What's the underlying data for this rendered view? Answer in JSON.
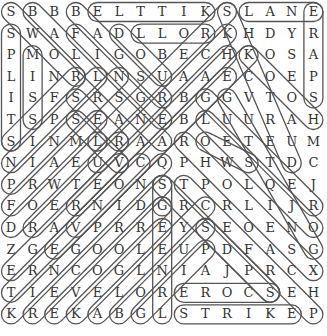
{
  "puzzle": {
    "type": "word-search",
    "rows": 15,
    "cols": 15,
    "grid": [
      [
        "S",
        "B",
        "B",
        "B",
        "E",
        "L",
        "T",
        "T",
        "I",
        "K",
        "S",
        "L",
        "A",
        "N",
        "E"
      ],
      [
        "S",
        "W",
        "A",
        "F",
        "A",
        "D",
        "L",
        "L",
        "O",
        "R",
        "K",
        "H",
        "D",
        "Y",
        "R"
      ],
      [
        "P",
        "M",
        "O",
        "L",
        "I",
        "G",
        "O",
        "B",
        "E",
        "C",
        "H",
        "K",
        "O",
        "S",
        "A"
      ],
      [
        "L",
        "I",
        "N",
        "R",
        "L",
        "N",
        "S",
        "U",
        "A",
        "A",
        "E",
        "C",
        "O",
        "E",
        "P"
      ],
      [
        "I",
        "S",
        "F",
        "S",
        "R",
        "S",
        "G",
        "R",
        "B",
        "G",
        "G",
        "V",
        "T",
        "O",
        "S"
      ],
      [
        "T",
        "S",
        "P",
        "S",
        "E",
        "A",
        "N",
        "E",
        "B",
        "L",
        "U",
        "U",
        "R",
        "A",
        "H"
      ],
      [
        "S",
        "I",
        "N",
        "M",
        "L",
        "R",
        "A",
        "A",
        "R",
        "O",
        "E",
        "T",
        "E",
        "U",
        "M"
      ],
      [
        "N",
        "I",
        "A",
        "E",
        "U",
        "V",
        "C",
        "Q",
        "P",
        "H",
        "W",
        "S",
        "T",
        "D",
        "C"
      ],
      [
        "P",
        "R",
        "W",
        "T",
        "E",
        "O",
        "N",
        "S",
        "T",
        "P",
        "O",
        "L",
        "Q",
        "E",
        "J"
      ],
      [
        "F",
        "O",
        "E",
        "R",
        "N",
        "I",
        "D",
        "G",
        "R",
        "C",
        "R",
        "L",
        "I",
        "J",
        "R"
      ],
      [
        "D",
        "R",
        "A",
        "V",
        "P",
        "R",
        "R",
        "E",
        "Y",
        "S",
        "E",
        "O",
        "E",
        "N",
        "O"
      ],
      [
        "Z",
        "G",
        "E",
        "G",
        "O",
        "O",
        "L",
        "E",
        "U",
        "P",
        "D",
        "F",
        "A",
        "S",
        "G"
      ],
      [
        "E",
        "R",
        "N",
        "C",
        "O",
        "G",
        "L",
        "N",
        "I",
        "A",
        "J",
        "P",
        "R",
        "C",
        "X"
      ],
      [
        "T",
        "I",
        "E",
        "V",
        "E",
        "L",
        "O",
        "R",
        "E",
        "R",
        "O",
        "C",
        "S",
        "E",
        "H"
      ],
      [
        "K",
        "R",
        "E",
        "K",
        "A",
        "B",
        "G",
        "L",
        "S",
        "T",
        "R",
        "I",
        "K",
        "E",
        "P"
      ]
    ],
    "highlights": [
      {
        "r1": 0,
        "c1": 4,
        "r2": 0,
        "c2": 9
      },
      {
        "r1": 0,
        "c1": 11,
        "r2": 0,
        "c2": 14
      },
      {
        "r1": 1,
        "c1": 6,
        "r2": 1,
        "c2": 9
      },
      {
        "r1": 13,
        "c1": 8,
        "r2": 13,
        "c2": 12
      },
      {
        "r1": 14,
        "c1": 8,
        "r2": 14,
        "c2": 13
      },
      {
        "r1": 1,
        "c1": 0,
        "r2": 6,
        "c2": 0
      },
      {
        "r1": 2,
        "c1": 1,
        "r2": 5,
        "c2": 1
      },
      {
        "r1": 0,
        "c1": 14,
        "r2": 4,
        "c2": 14
      },
      {
        "r1": 0,
        "c1": 0,
        "r2": 3,
        "c2": 3
      },
      {
        "r1": 0,
        "c1": 1,
        "r2": 6,
        "c2": 7
      },
      {
        "r1": 0,
        "c1": 3,
        "r2": 4,
        "c2": 7
      },
      {
        "r1": 1,
        "c1": 3,
        "r2": 5,
        "c2": 7
      },
      {
        "r1": 1,
        "c1": 5,
        "r2": 3,
        "c2": 7
      },
      {
        "r1": 0,
        "c1": 10,
        "r2": 6,
        "c2": 4
      },
      {
        "r1": 1,
        "c1": 10,
        "r2": 7,
        "c2": 4
      },
      {
        "r1": 2,
        "c1": 10,
        "r2": 9,
        "c2": 3
      },
      {
        "r1": 2,
        "c1": 11,
        "r2": 10,
        "c2": 3
      },
      {
        "r1": 3,
        "c1": 10,
        "r2": 11,
        "c2": 2
      },
      {
        "r1": 0,
        "c1": 10,
        "r2": 7,
        "c2": 13
      },
      {
        "r1": 2,
        "c1": 11,
        "r2": 5,
        "c2": 14
      },
      {
        "r1": 4,
        "c1": 9,
        "r2": 9,
        "c2": 14
      },
      {
        "r1": 4,
        "c1": 10,
        "r2": 11,
        "c2": 14
      },
      {
        "r1": 5,
        "c1": 9,
        "r2": 10,
        "c2": 14
      },
      {
        "r1": 6,
        "c1": 8,
        "r2": 12,
        "c2": 14
      },
      {
        "r1": 4,
        "c1": 3,
        "r2": 6,
        "c2": 5
      },
      {
        "r1": 5,
        "c1": 3,
        "r2": 7,
        "c2": 5
      },
      {
        "r1": 6,
        "c1": 9,
        "r2": 7,
        "c2": 11
      },
      {
        "r1": 6,
        "c1": 0,
        "r2": 3,
        "c2": 3
      },
      {
        "r1": 7,
        "c1": 0,
        "r2": 3,
        "c2": 4
      },
      {
        "r1": 8,
        "c1": 0,
        "r2": 3,
        "c2": 5
      },
      {
        "r1": 9,
        "c1": 0,
        "r2": 5,
        "c2": 4
      },
      {
        "r1": 10,
        "c1": 0,
        "r2": 6,
        "c2": 4
      },
      {
        "r1": 10,
        "c1": 1,
        "r2": 6,
        "c2": 5
      },
      {
        "r1": 12,
        "c1": 0,
        "r2": 7,
        "c2": 5
      },
      {
        "r1": 13,
        "c1": 0,
        "r2": 7,
        "c2": 6
      },
      {
        "r1": 14,
        "c1": 0,
        "r2": 7,
        "c2": 7
      },
      {
        "r1": 14,
        "c1": 1,
        "r2": 8,
        "c2": 7
      },
      {
        "r1": 14,
        "c1": 2,
        "r2": 9,
        "c2": 7
      },
      {
        "r1": 14,
        "c1": 3,
        "r2": 10,
        "c2": 7
      },
      {
        "r1": 14,
        "c1": 4,
        "r2": 9,
        "c2": 9
      },
      {
        "r1": 14,
        "c1": 5,
        "r2": 10,
        "c2": 9
      },
      {
        "r1": 14,
        "c1": 6,
        "r2": 11,
        "c2": 9
      },
      {
        "r1": 14,
        "c1": 7,
        "r2": 8,
        "c2": 7
      },
      {
        "r1": 8,
        "c1": 8,
        "r2": 14,
        "c2": 14
      },
      {
        "r1": 8,
        "c1": 7,
        "r2": 13,
        "c2": 12
      },
      {
        "r1": 9,
        "c1": 7,
        "r2": 9,
        "c2": 7
      },
      {
        "r1": 10,
        "c1": 9,
        "r2": 13,
        "c2": 12
      }
    ]
  }
}
